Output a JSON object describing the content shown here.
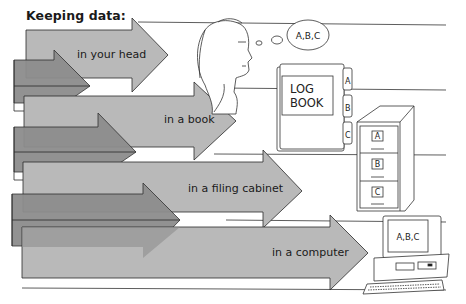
{
  "title": "Keeping data:",
  "methods": [
    {
      "label": "in your head",
      "icon": "person-thinking-icon"
    },
    {
      "label": "in a book",
      "icon": "log-book-icon"
    },
    {
      "label": "in a filing cabinet",
      "icon": "filing-cabinet-icon"
    },
    {
      "label": "in a computer",
      "icon": "computer-icon"
    }
  ],
  "thought_bubble": {
    "text": "A,B,C"
  },
  "log_book": {
    "cover_line1": "LOG",
    "cover_line2": "BOOK",
    "tabs": [
      "A",
      "B",
      "C"
    ]
  },
  "filing_cabinet": {
    "drawers": [
      "A",
      "B",
      "C"
    ]
  },
  "computer": {
    "screen_text": "A,B,C"
  },
  "colors": {
    "arrow_light": "#b7b7b7",
    "arrow_dark": "#8a8a8a",
    "outline": "#2a2a2a",
    "background": "#ffffff"
  }
}
